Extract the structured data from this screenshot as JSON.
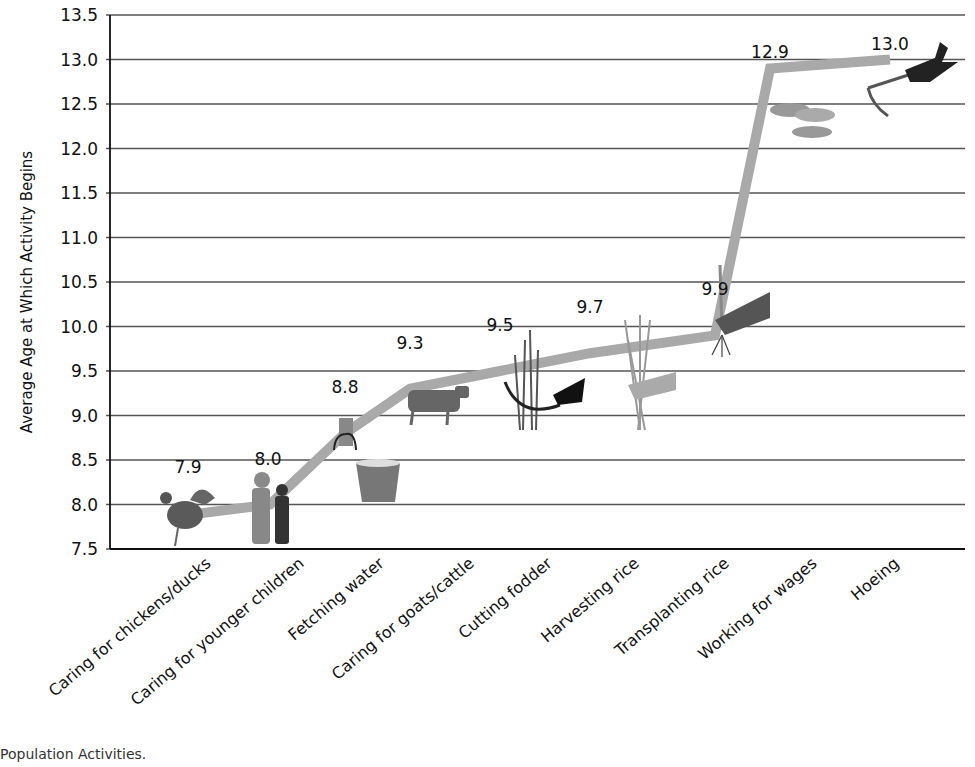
{
  "chart_data": {
    "type": "line",
    "title": "",
    "xlabel": "",
    "ylabel": "Average Age at Which Activity Begins",
    "ylim": [
      7.5,
      13.5
    ],
    "yticks": [
      "7.5",
      "8.0",
      "8.5",
      "9.0",
      "9.5",
      "10.0",
      "10.5",
      "11.0",
      "11.5",
      "12.0",
      "12.5",
      "13.0",
      "13.5"
    ],
    "grid": true,
    "legend": null,
    "categories": [
      "Caring for chickens/ducks",
      "Caring for younger children",
      "Fetching water",
      "Caring for goats/cattle",
      "Cutting fodder",
      "Harvesting  rice",
      "Transplanting rice",
      "Working for wages",
      "Hoeing"
    ],
    "series": [
      {
        "name": "Average age",
        "values": [
          7.9,
          8.0,
          8.8,
          9.3,
          9.5,
          9.7,
          9.9,
          12.9,
          13.0
        ],
        "color": "#a9a9a9"
      }
    ],
    "data_labels": [
      "7.9",
      "8.0",
      "8.8",
      "9.3",
      "9.5",
      "9.7",
      "9.9",
      "12.9",
      "13.0"
    ],
    "icons": [
      "rooster-icon",
      "children-icon",
      "bucket-icon",
      "cow-icon",
      "sickle-grass-icon",
      "rice-bundle-hand-icon",
      "seedling-hand-icon",
      "coins-icon",
      "hoe-hand-icon"
    ]
  },
  "caption": "Population Activities."
}
